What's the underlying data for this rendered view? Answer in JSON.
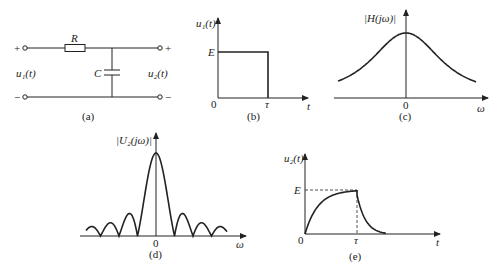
{
  "panels": {
    "a": {
      "caption": "(a)",
      "resistor_label": "R",
      "capacitor_label": "C",
      "input_label": "u₁(t)",
      "output_label": "u₂(t)",
      "plus": "+",
      "minus": "−"
    },
    "b": {
      "caption": "(b)",
      "ylabel": "u₁(t)",
      "xlabel": "t",
      "level_label": "E",
      "origin": "0",
      "tau": "τ"
    },
    "c": {
      "caption": "(c)",
      "ylabel": "|H(jω)|",
      "xlabel": "ω",
      "origin": "0"
    },
    "d": {
      "caption": "(d)",
      "ylabel": "|U₂(jω)|",
      "xlabel": "ω",
      "origin": "0"
    },
    "e": {
      "caption": "(e)",
      "ylabel": "u₂(t)",
      "xlabel": "t",
      "level_label": "E",
      "origin": "0",
      "tau": "τ"
    }
  }
}
